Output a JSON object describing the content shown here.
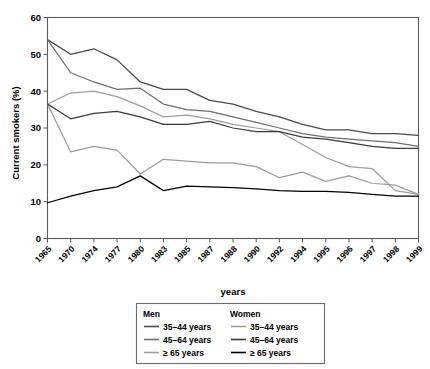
{
  "chart_data": {
    "type": "line",
    "title": "",
    "xlabel": "years",
    "ylabel": "Current smokers (%)",
    "ylim": [
      0,
      60
    ],
    "yticks": [
      0,
      10,
      20,
      30,
      40,
      50,
      60
    ],
    "grid": false,
    "legend_position": "bottom",
    "categories": [
      "1965",
      "1970",
      "1974",
      "1977",
      "1980",
      "1983",
      "1985",
      "1987",
      "1988",
      "1990",
      "1992",
      "1994",
      "1995",
      "1996",
      "1997",
      "1998",
      "1999"
    ],
    "series": [
      {
        "name": "Men 35–44 years",
        "group": "Men",
        "age": "35–44 years",
        "color": "#4a4a4a",
        "values": [
          54.0,
          50.0,
          51.5,
          48.5,
          42.5,
          40.5,
          40.5,
          37.5,
          36.5,
          34.5,
          33.0,
          31.0,
          29.5,
          29.5,
          28.5,
          28.5,
          28.0
        ]
      },
      {
        "name": "Men 45–64 years",
        "group": "Men",
        "age": "45–64 years",
        "color": "#6e6e6e",
        "values": [
          54.0,
          45.0,
          42.5,
          40.5,
          40.8,
          36.5,
          35.0,
          34.5,
          33.0,
          31.5,
          30.0,
          28.5,
          27.5,
          27.0,
          26.5,
          26.0,
          25.0
        ]
      },
      {
        "name": "Men ≥ 65 years",
        "group": "Men",
        "age": "≥ 65 years",
        "color": "#9d9d9d",
        "values": [
          36.5,
          39.5,
          40.0,
          38.5,
          36.0,
          33.0,
          33.5,
          32.5,
          31.0,
          30.0,
          29.0,
          25.5,
          22.0,
          19.5,
          19.0,
          13.0,
          12.0
        ]
      },
      {
        "name": "Women 35–44 years",
        "group": "Women",
        "age": "35–44 years",
        "color": "#9d9d9d",
        "values": [
          36.5,
          23.5,
          25.0,
          24.0,
          17.5,
          21.5,
          21.0,
          20.5,
          20.5,
          19.5,
          16.5,
          18.0,
          15.5,
          17.0,
          15.0,
          14.5,
          12.0
        ]
      },
      {
        "name": "Women 45–64 years",
        "group": "Women",
        "age": "45–64 years",
        "color": "#3a3a3a",
        "values": [
          36.5,
          32.5,
          34.0,
          34.5,
          33.0,
          31.0,
          31.0,
          31.8,
          30.0,
          29.0,
          29.0,
          27.5,
          27.0,
          26.0,
          25.0,
          24.5,
          24.5
        ]
      },
      {
        "name": "Women ≥ 65 years",
        "group": "Women",
        "age": "≥ 65 years",
        "color": "#000000",
        "values": [
          9.7,
          11.5,
          13.0,
          14.0,
          17.0,
          13.0,
          14.2,
          14.0,
          13.8,
          13.5,
          13.0,
          12.8,
          12.8,
          12.5,
          12.0,
          11.5,
          11.5
        ]
      }
    ]
  },
  "axes": {
    "ylabel": "Current smokers (%)",
    "xlabel": "years",
    "ytick_labels": [
      "0",
      "10",
      "20",
      "30",
      "40",
      "50",
      "60"
    ],
    "xtick_labels": [
      "1965",
      "1970",
      "1974",
      "1977",
      "1980",
      "1983",
      "1985",
      "1987",
      "1988",
      "1990",
      "1992",
      "1994",
      "1995",
      "1996",
      "1997",
      "1998",
      "1999"
    ]
  },
  "legend": {
    "columns": [
      {
        "header": "Men",
        "entries": [
          {
            "label": "35–44 years",
            "color": "#4a4a4a"
          },
          {
            "label": "45–64 years",
            "color": "#6e6e6e"
          },
          {
            "label": "≥ 65 years",
            "color": "#9d9d9d"
          }
        ]
      },
      {
        "header": "Women",
        "entries": [
          {
            "label": "35–44 years",
            "color": "#9d9d9d"
          },
          {
            "label": "45–64 years",
            "color": "#3a3a3a"
          },
          {
            "label": "≥ 65 years",
            "color": "#000000"
          }
        ]
      }
    ]
  }
}
